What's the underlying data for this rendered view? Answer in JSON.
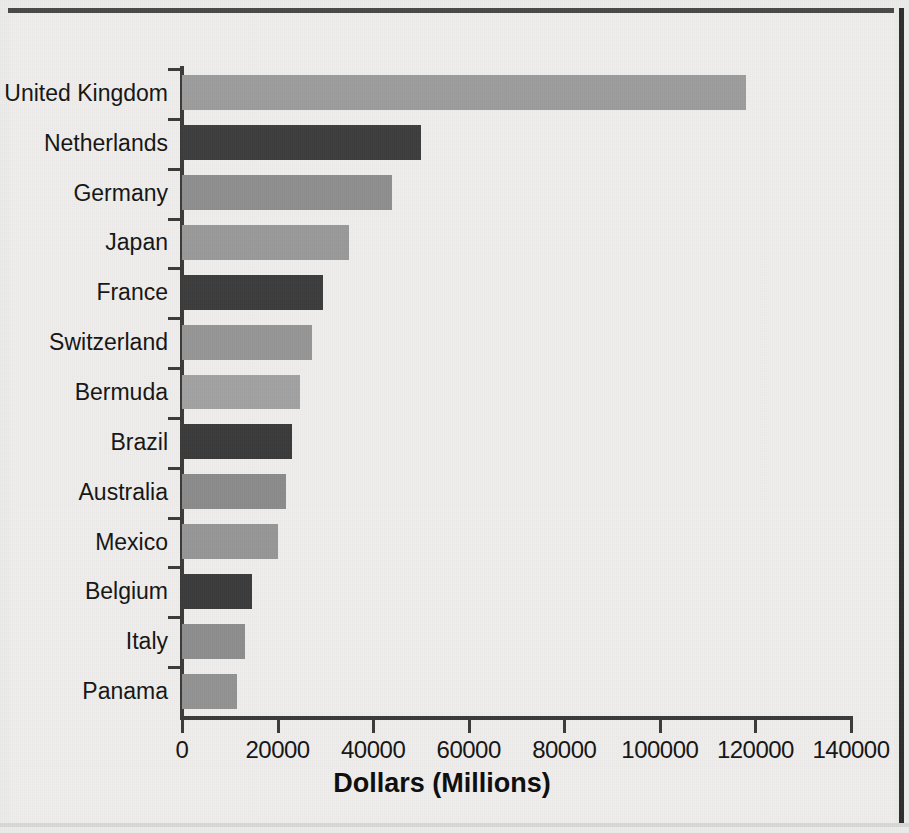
{
  "chart_data": {
    "type": "bar",
    "orientation": "horizontal",
    "title": "",
    "xlabel": "Dollars (Millions)",
    "ylabel": "",
    "xlim": [
      0,
      140000
    ],
    "xticks": [
      "0",
      "20000",
      "40000",
      "60000",
      "80000",
      "100000",
      "120000",
      "140000"
    ],
    "xtick_values": [
      0,
      20000,
      40000,
      60000,
      80000,
      100000,
      120000,
      140000
    ],
    "grid": false,
    "legend": "none",
    "categories": [
      "United Kingdom",
      "Netherlands",
      "Germany",
      "Japan",
      "France",
      "Switzerland",
      "Bermuda",
      "Brazil",
      "Australia",
      "Mexico",
      "Belgium",
      "Italy",
      "Panama"
    ],
    "values": [
      118000,
      50000,
      44000,
      35000,
      29500,
      27200,
      24700,
      23000,
      21800,
      20100,
      14600,
      13200,
      11500
    ],
    "bar_colors": [
      "#9d9d9d",
      "#3e3e3e",
      "#8f8f8f",
      "#9a9a9a",
      "#3d3d3d",
      "#969696",
      "#a2a2a2",
      "#3b3b3b",
      "#8c8c8c",
      "#979797",
      "#3c3c3c",
      "#8e8e8e",
      "#939393"
    ]
  },
  "colors": {
    "page_background": "#efeeec",
    "axis": "#3b3b3b",
    "text": "#151515",
    "bar_light": "#9a9a9a",
    "bar_dark": "#3d3d3d",
    "frame": "#3b3b3b"
  }
}
